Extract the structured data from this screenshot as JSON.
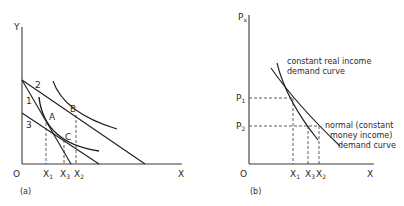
{
  "panel_a": {
    "caption": "(a)",
    "y_axis_label": "Y",
    "x_axis_label": "X",
    "origin_label": "O",
    "budget_line_labels": [
      "1",
      "2",
      "3"
    ],
    "point_labels": [
      "A",
      "B",
      "C"
    ],
    "x_ticks": [
      {
        "base": "X",
        "sub": "1"
      },
      {
        "base": "X",
        "sub": "3"
      },
      {
        "base": "X",
        "sub": "2"
      }
    ]
  },
  "panel_b": {
    "caption": "(b)",
    "y_axis_label": {
      "base": "P",
      "sub": "x"
    },
    "x_axis_label": "X",
    "origin_label": "O",
    "y_ticks": [
      {
        "base": "P",
        "sub": "1"
      },
      {
        "base": "P",
        "sub": "2"
      }
    ],
    "x_ticks": [
      {
        "base": "X",
        "sub": "1"
      },
      {
        "base": "X",
        "sub": "3"
      },
      {
        "base": "X",
        "sub": "2"
      }
    ],
    "curve_labels": {
      "constant_real": [
        "constant real income",
        "demand curve"
      ],
      "normal": [
        "normal (constant",
        "money income)",
        "demand curve"
      ]
    }
  }
}
